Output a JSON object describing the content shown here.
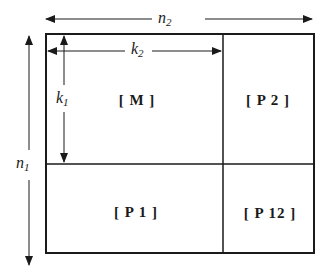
{
  "diagram": {
    "type": "partitioned-matrix",
    "colors": {
      "line": "#1a1a1a",
      "background": "#ffffff"
    },
    "dimensions": {
      "n2": {
        "base": "n",
        "sub": "2"
      },
      "n1": {
        "base": "n",
        "sub": "1"
      },
      "k2": {
        "base": "k",
        "sub": "2"
      },
      "k1": {
        "base": "k",
        "sub": "1"
      }
    },
    "blocks": [
      {
        "id": "M",
        "label": "[ M ]"
      },
      {
        "id": "P2",
        "label": "[ P 2 ]"
      },
      {
        "id": "P1",
        "label": "[ P 1 ]"
      },
      {
        "id": "P12",
        "label": "[ P 12 ]"
      }
    ]
  }
}
